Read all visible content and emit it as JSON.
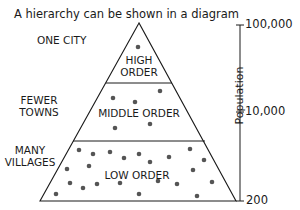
{
  "title": "A hierarchy can be shown in a diagram",
  "side_labels": {
    "top": "ONE CITY",
    "middle_line1": "FEWER",
    "middle_line2": "TOWNS",
    "bottom_line1": "MANY",
    "bottom_line2": "VILLAGES"
  },
  "tiers": {
    "high_line1": "HIGH",
    "high_line2": "ORDER",
    "middle": "MIDDLE ORDER",
    "low": "LOW ORDER"
  },
  "axis": {
    "label": "Population",
    "ticks": [
      "100,000",
      "10,000",
      "200"
    ]
  },
  "colors": {
    "line": "#1a1a1a",
    "dot": "#555555"
  }
}
